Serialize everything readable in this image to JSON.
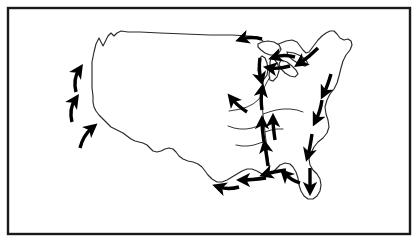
{
  "figure": {
    "title": "Outline map of the contiguous United States with migration flow arrows",
    "frame": {
      "name": "border-frame",
      "stroke_color": "#1a1a1a",
      "stroke_width": 2.4,
      "fill_color": "#ffffff",
      "x": 8,
      "y": 8,
      "width": 402,
      "height": 226
    },
    "background_color": "#ffffff",
    "line_color": "#2b2b2b",
    "arrow_color": "#000000",
    "outline_stroke_width": 1.15,
    "river_stroke_width": 0.95
  },
  "chart_data": {
    "type": "diagram",
    "regions": [
      {
        "name": "pacific-coast",
        "flow_direction": "north",
        "arrow_count": 3
      },
      {
        "name": "great-lakes",
        "flow_direction": "west",
        "arrow_count": 4
      },
      {
        "name": "northeast-atlantic",
        "flow_direction": "southwest",
        "arrow_count": 1
      },
      {
        "name": "atlantic-coast",
        "flow_direction": "south",
        "arrow_count": 4
      },
      {
        "name": "florida-gulf",
        "flow_direction": "west",
        "arrow_count": 5
      },
      {
        "name": "mississippi-system",
        "flow_direction": "north-upstream",
        "arrow_count": 5
      }
    ],
    "legend": [],
    "xlabel": "",
    "ylabel": ""
  },
  "geometry": {
    "coastline_path": "M 92,74 L 92,62 L 94,52 L 96,44 L 99,38 L 101,42 L 103,46 L 105,42 L 108,36 L 111,33 L 114,36 L 117,33 L 121,31 L 128,32 L 140,32 L 160,33 L 185,34 L 210,35 L 232,35 L 248,36 L 258,37 L 262,40 L 265,44 L 270,46 L 276,45 L 281,43 L 286,41 L 292,40 L 297,42 L 300,46 L 303,50 L 306,53 L 309,52 L 312,48 L 315,44 L 318,40 L 322,36 L 326,33 L 330,31 L 334,31 L 337,34 L 340,38 L 344,40 L 348,39 L 351,41 L 352,45 L 350,50 L 346,55 L 343,61 L 341,68 L 339,76 L 337,83 L 334,89 L 330,94 L 327,100 L 325,107 L 326,114 L 328,120 L 329,127 L 327,133 L 323,138 L 318,142 L 314,147 L 311,153 L 309,159 L 310,165 L 313,170 L 317,174 L 320,179 L 321,185 L 320,191 L 317,196 L 313,199 L 308,199 L 304,196 L 301,191 L 299,185 L 298,178 L 296,172 L 293,167 L 290,164 L 285,163 L 280,165 L 276,169 L 272,173 L 267,175 L 262,174 L 257,171 L 252,169 L 247,169 L 242,171 L 237,174 L 232,177 L 227,180 L 222,182 L 217,182 L 212,179 L 208,175 L 205,171 L 202,167 L 198,164 L 193,162 L 188,161 L 183,159 L 179,156 L 176,152 L 173,149 L 169,148 L 165,149 L 161,151 L 157,152 L 153,151 L 150,148 L 147,145 L 143,143 L 139,142 L 135,141 L 131,139 L 127,136 L 123,133 L 119,131 L 115,129 L 111,127 L 108,124 L 105,121 L 102,118 L 99,115 L 96,111 L 94,107 L 93,102 L 93,96 L 92,88 Z",
    "west_coast_detail": "M 92,74 L 94,80 L 95,86 L 94,92 L 93,98 L 94,104 L 96,110 L 99,116 L 102,121 L 106,126 L 110,130",
    "great_lakes": [
      "M 258,44 L 262,42 L 268,41 L 274,42 L 279,45 L 281,49 L 279,53 L 275,55 L 270,55 L 265,53 L 261,50 L 258,47 Z",
      "M 262,56 L 265,58 L 267,63 L 268,69 L 267,75 L 264,79 L 261,80 L 259,76 L 258,70 L 259,63 L 260,58 Z",
      "M 271,58 L 275,60 L 278,65 L 279,71 L 277,77 L 273,81 L 270,80 L 269,75 L 270,68 L 270,62 Z",
      "M 281,60 L 287,62 L 292,66 L 296,70 L 298,74 L 295,77 L 290,76 L 285,73 L 281,69 L 279,64 Z",
      "M 287,52 L 294,53 L 301,56 L 306,60 L 308,64 L 305,66 L 299,64 L 293,60 L 288,56 Z"
    ],
    "rivers": [
      "M 262,95 L 262,105 L 263,114 L 264,123 L 265,132 L 266,141 L 267,150 L 268,158 L 269,165 L 269,172",
      "M 262,95 L 258,100 L 253,104 L 247,107 L 241,109 L 235,110 L 229,111",
      "M 264,123 L 258,126 L 252,128 L 246,129 L 240,129 L 234,128 L 228,126",
      "M 266,141 L 260,143 L 254,145 L 248,146 L 242,146 L 236,145",
      "M 263,114 L 269,112 L 276,110 L 283,109 L 290,109 L 297,110 L 303,112",
      "M 262,95 L 264,88 L 267,82 L 270,77",
      "M 265,132 L 271,130 L 277,129 L 283,129"
    ],
    "arrows": [
      {
        "name": "pacific-arrow-north-1",
        "path": "M 76,92 C 74,84 75,76 79,70",
        "direction": "north"
      },
      {
        "name": "pacific-arrow-north-2",
        "path": "M 72,122 C 70,114 71,106 75,100",
        "direction": "north"
      },
      {
        "name": "pacific-arrow-north-3",
        "path": "M 80,148 C 82,140 86,133 92,128",
        "direction": "northeast"
      },
      {
        "name": "great-lakes-arrow-west-1",
        "path": "M 262,39 C 255,37 248,37 242,39",
        "direction": "west"
      },
      {
        "name": "great-lakes-arrow-west-2",
        "path": "M 295,57 C 288,55 281,55 275,57",
        "direction": "west"
      },
      {
        "name": "great-lakes-arrow-west-3",
        "path": "M 290,66 C 283,68 276,69 270,68",
        "direction": "west"
      },
      {
        "name": "great-lakes-arrow-south-1",
        "path": "M 260,58 C 259,65 259,72 261,79",
        "direction": "south"
      },
      {
        "name": "northeast-arrow-southwest",
        "path": "M 318,48 C 312,54 306,59 300,63",
        "direction": "southwest"
      },
      {
        "name": "atlantic-arrow-south-1",
        "path": "M 331,74 C 329,81 327,87 324,93",
        "direction": "south"
      },
      {
        "name": "atlantic-arrow-south-2",
        "path": "M 322,100 C 321,107 319,114 316,120",
        "direction": "south"
      },
      {
        "name": "atlantic-arrow-south-3",
        "path": "M 312,134 C 311,141 310,148 308,155",
        "direction": "south"
      },
      {
        "name": "florida-arrow-south",
        "path": "M 310,168 C 310,175 310,182 310,189",
        "direction": "south"
      },
      {
        "name": "gulf-arrow-west-1",
        "path": "M 300,183 C 294,181 289,178 285,174",
        "direction": "northwest"
      },
      {
        "name": "gulf-arrow-west-2",
        "path": "M 286,170 C 279,171 272,172 266,174",
        "direction": "west"
      },
      {
        "name": "gulf-arrow-west-3",
        "path": "M 266,178 C 258,179 250,180 243,180",
        "direction": "west"
      },
      {
        "name": "gulf-arrow-west-4",
        "path": "M 239,187 C 232,189 225,189 219,187",
        "direction": "west"
      },
      {
        "name": "mississippi-arrow-north-1",
        "path": "M 268,166 C 267,159 266,152 265,146",
        "direction": "north"
      },
      {
        "name": "mississippi-arrow-north-2",
        "path": "M 264,142 C 263,135 262,128 262,122",
        "direction": "north"
      },
      {
        "name": "mississippi-arrow-north-3",
        "path": "M 275,140 C 274,133 273,126 273,120",
        "direction": "north"
      },
      {
        "name": "mississippi-arrow-north-4",
        "path": "M 262,110 C 261,103 261,96 262,90",
        "direction": "north"
      },
      {
        "name": "ohio-arrow-northwest",
        "path": "M 247,112 C 241,108 236,104 232,99",
        "direction": "northwest"
      }
    ]
  }
}
